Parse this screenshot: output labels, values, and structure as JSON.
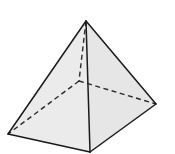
{
  "diagram": {
    "type": "square-pyramid",
    "background_color": "#ffffff",
    "face_color_left": "#ebebeb",
    "face_color_right": "#e6e6e6",
    "edge_color": "#1a1a1a",
    "hidden_edge_color": "#2a2a2a",
    "vertices": {
      "apex": [
        86,
        21
      ],
      "left": [
        8,
        134
      ],
      "front": [
        90,
        152
      ],
      "right": [
        156,
        104
      ],
      "back_hidden": [
        79,
        81
      ]
    },
    "visible_edges": [
      [
        "apex",
        "left"
      ],
      [
        "apex",
        "front"
      ],
      [
        "apex",
        "right"
      ],
      [
        "left",
        "front"
      ],
      [
        "front",
        "right"
      ]
    ],
    "hidden_edges": [
      [
        "apex",
        "back_hidden"
      ],
      [
        "back_hidden",
        "left"
      ],
      [
        "back_hidden",
        "right"
      ]
    ]
  }
}
